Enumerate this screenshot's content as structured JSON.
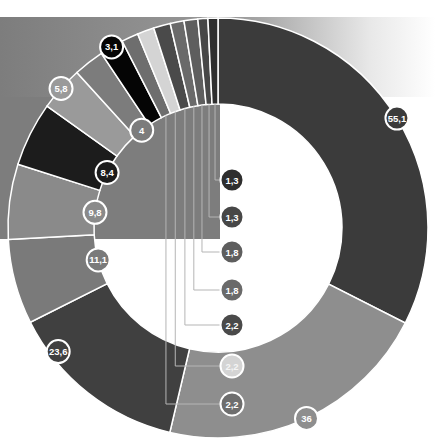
{
  "chart_data": {
    "type": "pie",
    "variant": "donut",
    "title": "",
    "start_angle_deg": 0,
    "direction": "clockwise",
    "decimal_separator": ",",
    "slices": [
      {
        "label": "55,1",
        "value": 55.1,
        "color": "#3b3b3b"
      },
      {
        "label": "36",
        "value": 36.0,
        "color": "#8e8e8e"
      },
      {
        "label": "23,6",
        "value": 23.6,
        "color": "#404040"
      },
      {
        "label": "11,1",
        "value": 11.1,
        "color": "#7a7a7a"
      },
      {
        "label": "9,8",
        "value": 9.8,
        "color": "#8a8a8a"
      },
      {
        "label": "8,4",
        "value": 8.4,
        "color": "#1c1c1c"
      },
      {
        "label": "5,8",
        "value": 5.8,
        "color": "#9a9a9a"
      },
      {
        "label": "4",
        "value": 4.0,
        "color": "#7c7c7c"
      },
      {
        "label": "3,1",
        "value": 3.1,
        "color": "#050505"
      },
      {
        "label": "2,2",
        "value": 2.2,
        "color": "#6e6e6e"
      },
      {
        "label": "2,2",
        "value": 2.2,
        "color": "#d4d4d4"
      },
      {
        "label": "2,2",
        "value": 2.2,
        "color": "#4a4a4a"
      },
      {
        "label": "1,8",
        "value": 1.8,
        "color": "#6a6a6a"
      },
      {
        "label": "1,8",
        "value": 1.8,
        "color": "#5e5e5e"
      },
      {
        "label": "1,3",
        "value": 1.3,
        "color": "#474747"
      },
      {
        "label": "1,3",
        "value": 1.3,
        "color": "#2e2e2e"
      }
    ],
    "legend": "none",
    "grid": false
  },
  "layout": {
    "cx": 218,
    "cy": 228,
    "r_outer": 210,
    "r_inner": 124,
    "background_block": {
      "x": 0,
      "y": 17,
      "w": 220,
      "h": 222,
      "color": "#7d7d7d"
    }
  }
}
